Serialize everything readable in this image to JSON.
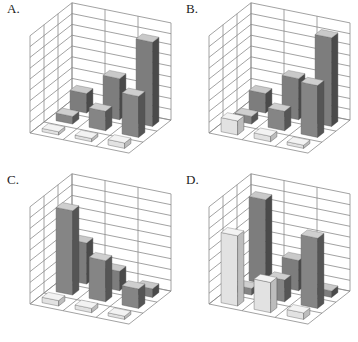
{
  "figure": {
    "background": "#ffffff",
    "grid_color": "#8a8a8a",
    "row_colors": {
      "back": {
        "front": "#7d7d7d",
        "side": "#4a4a4a",
        "top": "#c9c9c9"
      },
      "middle": {
        "front": "#858585",
        "side": "#555555",
        "top": "#cfcfcf"
      },
      "front": {
        "front": "#e2e2e2",
        "side": "#bdbdbd",
        "top": "#f3f3f3"
      }
    }
  },
  "chart_data": [
    {
      "type": "bar3d",
      "label": "A.",
      "offset": [
        0,
        0
      ],
      "categories": [
        "col1",
        "col2",
        "col3"
      ],
      "series": [
        {
          "name": "back",
          "values": [
            1.8,
            3.8,
            7.8
          ]
        },
        {
          "name": "middle",
          "values": [
            0.7,
            1.8,
            3.8
          ]
        },
        {
          "name": "front",
          "values": [
            0.3,
            0.3,
            0.5
          ]
        }
      ],
      "zlim": [
        0,
        9
      ],
      "grid": true
    },
    {
      "type": "bar3d",
      "label": "B.",
      "offset": [
        179,
        0
      ],
      "categories": [
        "col1",
        "col2",
        "col3"
      ],
      "series": [
        {
          "name": "back",
          "values": [
            1.8,
            3.8,
            8.2
          ]
        },
        {
          "name": "middle",
          "values": [
            0.7,
            1.8,
            4.8
          ]
        },
        {
          "name": "front",
          "values": [
            1.3,
            0.5,
            0.3
          ]
        }
      ],
      "zlim": [
        0,
        9
      ],
      "grid": true
    },
    {
      "type": "bar3d",
      "label": "C.",
      "offset": [
        0,
        171
      ],
      "categories": [
        "col1",
        "col2",
        "col3"
      ],
      "series": [
        {
          "name": "back",
          "values": [
            3.8,
            1.8,
            0.8
          ]
        },
        {
          "name": "middle",
          "values": [
            7.8,
            3.8,
            1.8
          ]
        },
        {
          "name": "front",
          "values": [
            0.5,
            0.4,
            0.3
          ]
        }
      ],
      "zlim": [
        0,
        9
      ],
      "grid": true
    },
    {
      "type": "bar3d",
      "label": "D.",
      "offset": [
        179,
        171
      ],
      "categories": [
        "col1",
        "col2",
        "col3"
      ],
      "series": [
        {
          "name": "back",
          "values": [
            7.8,
            2.8,
            0.6
          ]
        },
        {
          "name": "middle",
          "values": [
            0.6,
            2.0,
            6.5
          ]
        },
        {
          "name": "front",
          "values": [
            6.5,
            2.8,
            0.6
          ]
        }
      ],
      "zlim": [
        0,
        9
      ],
      "grid": true
    }
  ]
}
